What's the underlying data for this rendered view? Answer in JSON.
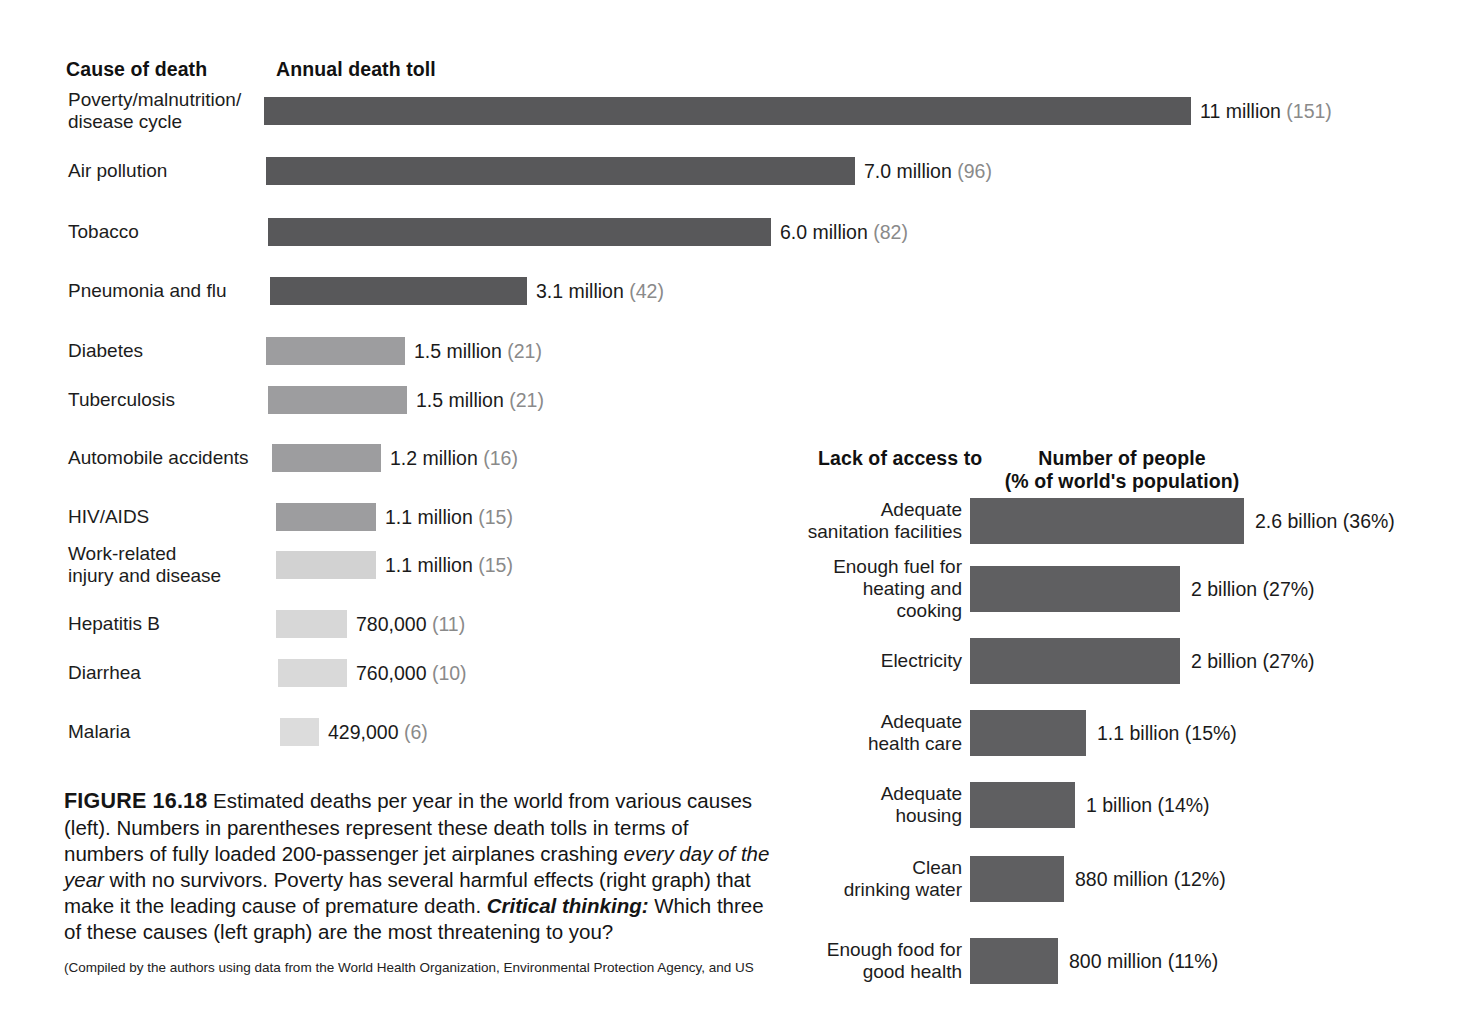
{
  "figure": {
    "number": "FIGURE 16.18",
    "caption_text": " Estimated deaths per year in the world from various causes (left). Numbers in parentheses represent these death tolls in terms of numbers of fully loaded 200-passenger jet airplanes crashing ",
    "caption_italic": "every day of the year",
    "caption_text2": " with no survivors. Poverty has several harmful effects (right graph) that make it the leading cause of premature death. ",
    "critical_thinking_label": "Critical thinking:",
    "critical_thinking_text": " Which three of these causes (left graph) are the most threatening to you?",
    "source": "(Compiled by the authors using data from the World Health Organization, Environmental Protection Agency, and US"
  },
  "left_chart": {
    "header_category": "Cause of death",
    "header_value": "Annual death toll"
  },
  "right_chart": {
    "header_category": "Lack of\naccess to",
    "header_value_line1": "Number of people",
    "header_value_line2": "(% of world's population)"
  },
  "chart_data": [
    {
      "type": "bar",
      "orientation": "horizontal",
      "title": "Annual death toll",
      "xlabel": "Annual death toll",
      "ylabel": "Cause of death",
      "grid": false,
      "legend": "none",
      "units": "deaths per year",
      "categories": [
        "Poverty/malnutrition/\ndisease cycle",
        "Air pollution",
        "Tobacco",
        "Pneumonia and flu",
        "Diabetes",
        "Tuberculosis",
        "Automobile accidents",
        "HIV/AIDS",
        "Work-related\ninjury and disease",
        "Hepatitis B",
        "Diarrhea",
        "Malaria"
      ],
      "values": [
        11000000,
        7000000,
        6000000,
        3100000,
        1500000,
        1500000,
        1200000,
        1100000,
        1100000,
        780000,
        760000,
        429000
      ],
      "value_labels": [
        "11 million",
        "7.0 million",
        "6.0  million",
        "3.1 million",
        "1.5 million",
        "1.5 million",
        "1.2 million",
        "1.1 million",
        "1.1 million",
        "780,000",
        "760,000",
        "429,000"
      ],
      "paren_labels": [
        "(151)",
        "(96)",
        "(82)",
        "(42)",
        "(21)",
        "(21)",
        "(16)",
        "(15)",
        "(15)",
        "(11)",
        "(10)",
        "(6)"
      ],
      "paren_meaning": "equivalent fully loaded 200-passenger jet airplanes crashing every day of the year",
      "bar_colors": [
        "#58585a",
        "#58585a",
        "#58585a",
        "#58585a",
        "#9d9d9f",
        "#9d9d9f",
        "#9d9d9f",
        "#9d9d9f",
        "#d2d2d2",
        "#d7d7d7",
        "#d9d9d9",
        "#dcdcdc"
      ],
      "bar_px_start": [
        264,
        266,
        268,
        270,
        266,
        268,
        272,
        276,
        276,
        276,
        278,
        280
      ],
      "bar_px_width": [
        927,
        589,
        503,
        257,
        139,
        139,
        109,
        100,
        100,
        71,
        69,
        39
      ],
      "row_px_top": [
        97,
        157,
        218,
        277,
        337,
        386,
        444,
        503,
        551,
        610,
        659,
        718
      ]
    },
    {
      "type": "bar",
      "orientation": "horizontal",
      "title": "Number of people (% of world's population)",
      "xlabel": "Number of people (% of world's population)",
      "ylabel": "Lack of access to",
      "grid": false,
      "legend": "none",
      "units": "people",
      "categories": [
        "Adequate\nsanitation facilities",
        "Enough fuel for\nheating and cooking",
        "Electricity",
        "Adequate\nhealth care",
        "Adequate\nhousing",
        "Clean\ndrinking water",
        "Enough food for\ngood health"
      ],
      "values": [
        2600000000,
        2000000000,
        2000000000,
        1100000000,
        1000000000,
        880000000,
        800000000
      ],
      "value_labels": [
        "2.6 billion (36%)",
        "2 billion (27%)",
        "2 billion (27%)",
        "1.1 billion (15%)",
        "1 billion (14%)",
        "880 million (12%)",
        "800 million (11%)"
      ],
      "percentages": [
        36,
        27,
        27,
        15,
        14,
        12,
        11
      ],
      "bar_color": "#5f5f61",
      "bar_px_width": [
        274,
        210,
        210,
        116,
        105,
        94,
        88
      ],
      "row_px_top": [
        498,
        566,
        638,
        710,
        782,
        856,
        938
      ]
    }
  ],
  "colors": {
    "bar_dark": "#58585a",
    "bar_medium": "#9d9d9f",
    "bar_light": "#d9d9d9",
    "right_bar": "#5f5f61",
    "text": "#1a1a1a",
    "paren_text": "#8a8a8a",
    "background": "#ffffff"
  }
}
